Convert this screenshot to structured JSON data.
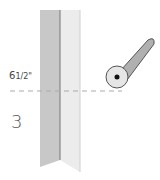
{
  "diagram": {
    "measurement": "6½\"",
    "measurement_whole": "6",
    "measurement_frac": "1/2\"",
    "step_number": "3",
    "colors": {
      "fabric_left": "#c8c8c8",
      "fabric_right": "#ececec",
      "fold_line": "#888888",
      "cut_line": "#aaaaaa",
      "cutter_handle": "#b0b0b0",
      "cutter_wheel": "#e6e6e6",
      "outline": "#555555"
    },
    "icons": {
      "cutter": "rotary-cutter-icon"
    }
  }
}
